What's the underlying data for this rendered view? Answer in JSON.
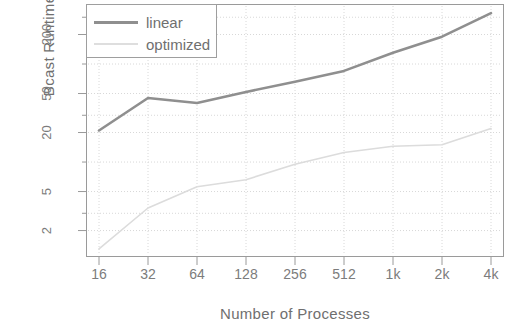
{
  "chart_data": {
    "type": "line",
    "title": "",
    "xlabel": "Number of Processes",
    "ylabel": "Bcast Runtime [us]",
    "xscale": "log2",
    "yscale": "log10",
    "grid": true,
    "legend_position": "top-left",
    "categories": [
      "16",
      "32",
      "64",
      "128",
      "256",
      "512",
      "1k",
      "2k",
      "4k"
    ],
    "x": [
      16,
      32,
      64,
      128,
      256,
      512,
      1024,
      2048,
      4096
    ],
    "xtick_labels": [
      "16",
      "32",
      "64",
      "128",
      "256",
      "512",
      "1k",
      "2k",
      "4k"
    ],
    "ytick_labels": [
      "2",
      "5",
      "20",
      "50",
      "200"
    ],
    "ytick_values": [
      2,
      5,
      20,
      50,
      200
    ],
    "ylim": [
      1.1,
      400
    ],
    "series": [
      {
        "name": "linear",
        "color": "#8f8f8f",
        "values": [
          21,
          45,
          40,
          52,
          66,
          85,
          130,
          190,
          330
        ]
      },
      {
        "name": "optimized",
        "color": "#dcdcdc",
        "values": [
          1.3,
          3.4,
          5.6,
          6.6,
          9.5,
          12.5,
          14.5,
          15.0,
          22.0
        ]
      }
    ]
  },
  "axes": {
    "y_title": "Bcast Runtime [us]",
    "x_title": "Number of Processes",
    "y_ticks": [
      "200",
      "50",
      "20",
      "5",
      "2"
    ],
    "x_ticks": [
      "16",
      "32",
      "64",
      "128",
      "256",
      "512",
      "1k",
      "2k",
      "4k"
    ]
  },
  "legend": {
    "entries": [
      {
        "label": "linear",
        "color": "#8f8f8f"
      },
      {
        "label": "optimized",
        "color": "#dedede"
      }
    ]
  },
  "colors": {
    "linear": "#8f8f8f",
    "optimized": "#dedede",
    "frame": "#9a9a9a",
    "grid": "#d8d8d8",
    "text": "#7c7c7c",
    "background": "#ffffff"
  }
}
